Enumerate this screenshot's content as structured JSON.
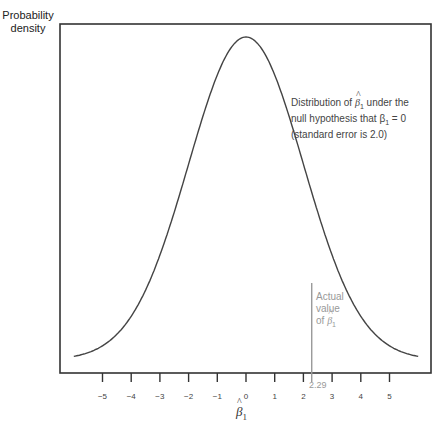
{
  "chart_data": {
    "type": "line",
    "title": "",
    "ylabel": "Probability density",
    "xlabel": "β̂1",
    "xlim": [
      -6,
      6
    ],
    "x_ticks": [
      -5,
      -4,
      -3,
      -2,
      -1,
      0,
      1,
      2,
      3,
      4,
      5
    ],
    "tick_labels": [
      "−5",
      "−4",
      "−3",
      "−2",
      "−1",
      "0",
      "1",
      "2",
      "3",
      "4",
      "5"
    ],
    "grid": false,
    "series": [
      {
        "name": "Distribution of β̂1 under the null hypothesis that β1 = 0 (standard error is 2.0)",
        "distribution": "normal",
        "mean": 0,
        "std_error": 2.0,
        "x_range": [
          -6,
          6
        ]
      }
    ],
    "annotations": [
      {
        "text_lines": [
          "Distribution of β̂1 under the",
          "null hypothesis that β1 = 0",
          "(standard error is 2.0)"
        ]
      },
      {
        "text_lines": [
          "Actual",
          "value",
          "of β̂1"
        ],
        "x": 2.29,
        "value_label": "2.29"
      }
    ]
  },
  "labels": {
    "ylabel_line1": "Probability",
    "ylabel_line2": "density",
    "annot_line1_a": "Distribution of ",
    "annot_line1_b": " under the",
    "annot_line2": "null hypothesis that β",
    "annot_line2_b": " = 0",
    "annot_line3": "(standard error is 2.0)",
    "actual_line1": "Actual",
    "actual_line2": "value",
    "actual_line3": "of ",
    "beta_symbol": "β",
    "sub_1": "1",
    "actual_value": "2.29"
  }
}
